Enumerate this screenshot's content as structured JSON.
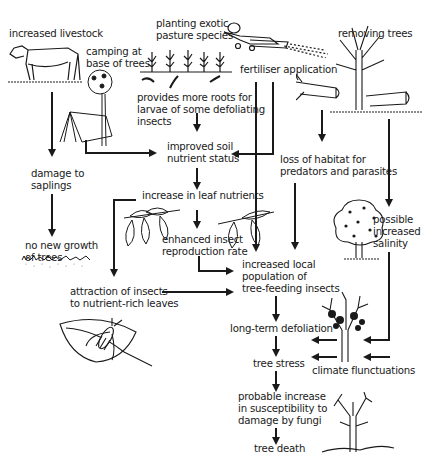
{
  "diagram": {
    "type": "flowchart",
    "topic": "causes of rural tree dieback",
    "nodes": {
      "livestock": "increased livestock",
      "camping_1": "camping at",
      "camping_2": "base of trees",
      "planting_1": "planting exotic",
      "planting_2": "pasture species",
      "roots_1": "provides more roots for",
      "roots_2": "larvae of some defoliating",
      "roots_3": "insects",
      "fertiliser": "fertiliser application",
      "removing": "removing trees",
      "saplings_1": "damage to",
      "saplings_2": "saplings",
      "soil_1": "improved soil",
      "soil_2": "nutrient status",
      "habitat_1": "loss of habitat for",
      "habitat_2": "predators and parasites",
      "leaf": "increase in leaf nutrients",
      "nogrowth_1": "no new growth",
      "nogrowth_2": "of trees",
      "salinity_1": "possible",
      "salinity_2": "increased",
      "salinity_3": "salinity",
      "repro_1": "enhanced insect",
      "repro_2": "reproduction rate",
      "population_1": "increased local",
      "population_2": "population of",
      "population_3": "tree-feeding insects",
      "attraction_1": "attraction of insects",
      "attraction_2": "to nutrient-rich leaves",
      "defoliation": "long-term defoliation",
      "stress": "tree stress",
      "climate": "climate flunctuations",
      "fungi_1": "probable increase",
      "fungi_2": "in susceptibility to",
      "fungi_3": "damage by fungi",
      "death": "tree death"
    },
    "illustrations": [
      "cow-icon",
      "tent-and-tree-icon",
      "pasture-plants-icon",
      "crop-duster-plane-icon",
      "felled-trees-icon",
      "leaves-icon",
      "healthy-tree-icon",
      "insect-on-leaf-icon",
      "sick-tree-icon",
      "dead-tree-icon",
      "sparse-ground-icon"
    ],
    "colors": {
      "ink": "#1a1a1a",
      "background": "#ffffff"
    }
  }
}
